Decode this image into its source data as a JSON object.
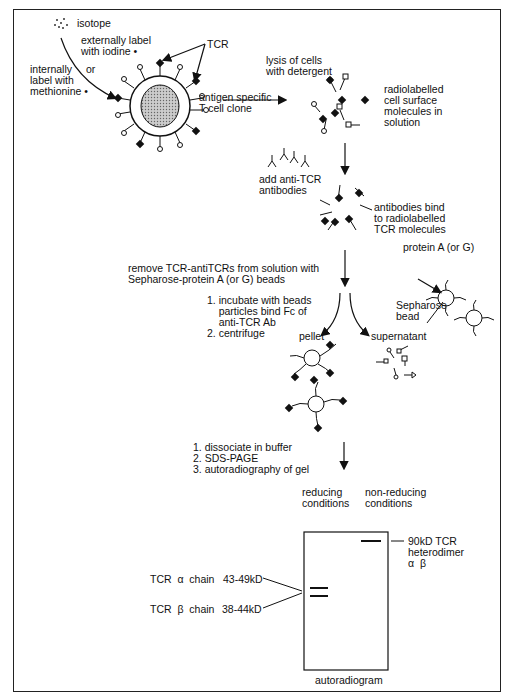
{
  "figure": {
    "isotope_label": "isotope",
    "external_label": "externally label\nwith iodine •",
    "internal_label": "internally\nlabel with\nmethionine •",
    "or_label": "or",
    "tcr_label": "TCR",
    "cell_label": "antigen specific\nT cell clone",
    "lysis_label": "lysis of cells\nwith detergent",
    "solution_label": "radiolabelled\ncell surface\nmolecules in\nsolution",
    "add_antibody_label": "add anti-TCR\nantibodies",
    "bind_label": "antibodies bind\nto radiolabelled\nTCR molecules",
    "remove_label": "remove TCR-antiTCRs from solution with\nSepharose-protein A (or G) beads",
    "protein_a_label": "protein A (or G)",
    "sepharose_label": "Sepharose\nbead",
    "steps_incubate": "1. incubate with beads\n    particles bind Fc of\n    anti-TCR Ab\n2. centrifuge",
    "pellet_label": "pellet",
    "supernatant_label": "supernatant",
    "steps_gel": "1. dissociate in buffer\n2. SDS-PAGE\n3. autoradiography of gel",
    "reducing_label": "reducing\nconditions",
    "nonreducing_label": "non-reducing\nconditions",
    "heterodimer_label": "90kD TCR\nheterodimer\nα  β",
    "alpha_chain_label": "TCR  α  chain",
    "alpha_kd": "43-49kD",
    "beta_chain_label": "TCR  β  chain",
    "beta_kd": "38-44kD",
    "autoradiogram_label": "autoradiogram"
  }
}
